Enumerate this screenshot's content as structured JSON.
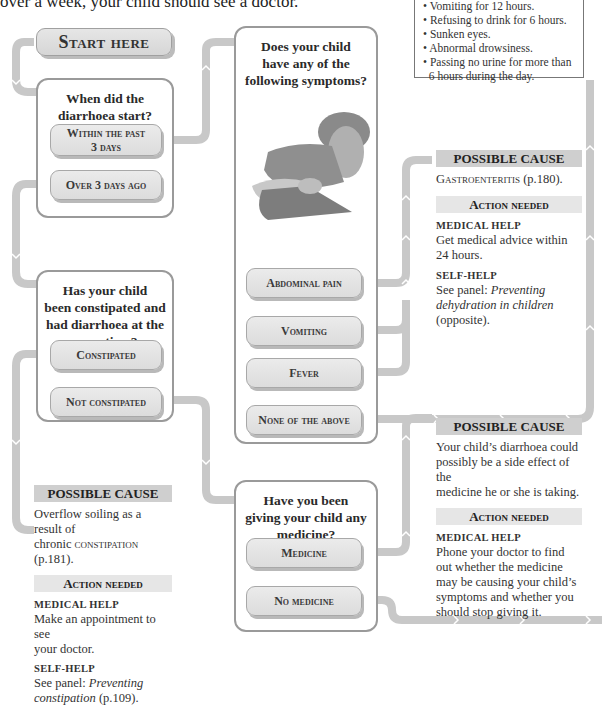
{
  "intro": {
    "text": "over a week, your child should see a doctor."
  },
  "warning_panel": {
    "items": [
      "Vomiting for 12 hours.",
      "Refusing to drink for 6 hours.",
      "Sunken eyes.",
      "Abnormal drowsiness.",
      "Passing no urine for more than",
      "6 hours during the day."
    ]
  },
  "start": {
    "label": "Start here"
  },
  "q1": {
    "title": [
      "When did the",
      "diarrhoea start?"
    ],
    "options": [
      {
        "label_line1": "Within the past",
        "label_line2": "3 days"
      },
      {
        "label_line1": "Over 3 days ago"
      }
    ]
  },
  "q2": {
    "title": [
      "Does your child",
      "have any of the",
      "following symptoms?"
    ],
    "image": "photo-of-child-holding-abdomen",
    "options": [
      {
        "label": "Abdominal pain"
      },
      {
        "label": "Vomiting"
      },
      {
        "label": "Fever"
      },
      {
        "label": "None of the above"
      }
    ]
  },
  "q3": {
    "title": [
      "Has your child",
      "been constipated and",
      "had diarrhoea at the",
      "same time?"
    ],
    "options": [
      {
        "label": "Constipated"
      },
      {
        "label": "Not constipated"
      }
    ]
  },
  "q4": {
    "title": [
      "Have you been",
      "giving your child any",
      "medicine?"
    ],
    "options": [
      {
        "label": "Medicine"
      },
      {
        "label": "No medicine"
      }
    ]
  },
  "result_gastro": {
    "cause_heading": "POSSIBLE CAUSE",
    "cause_condition": "Gastroenteritis",
    "cause_ref": " (p.180).",
    "action_heading": "Action needed",
    "medical_label": "MEDICAL HELP",
    "medical_text": [
      "Get medical advice within",
      "24 hours."
    ],
    "self_label": "SELF-HELP",
    "self_prefix": "See panel: ",
    "self_italic_1": "Preventing",
    "self_italic_2": "dehydration in children",
    "self_suffix": "(opposite)."
  },
  "result_constipation": {
    "cause_heading": "POSSIBLE CAUSE",
    "cause_line1": "Overflow soiling as a result of",
    "cause_prefix": "chronic ",
    "cause_condition": "constipation",
    "cause_ref": " (p.181).",
    "action_heading": "Action needed",
    "medical_label": "MEDICAL HELP",
    "medical_text": [
      "Make an appointment to see",
      "your doctor."
    ],
    "self_label": "SELF-HELP",
    "self_prefix": "See panel: ",
    "self_italic_1": "Preventing",
    "self_italic_2": "constipation",
    "self_suffix": " (p.109)."
  },
  "result_medicine": {
    "cause_heading": "POSSIBLE CAUSE",
    "cause_text": [
      "Your child’s diarrhoea could",
      "possibly be a side effect of the",
      "medicine he or she is taking."
    ],
    "action_heading": "Action needed",
    "medical_label": "MEDICAL HELP",
    "medical_text": [
      "Phone your doctor to find",
      "out whether the medicine",
      "may be causing your child’s",
      "symptoms and whether you",
      "should stop giving it."
    ]
  },
  "colors": {
    "connector": "#c8c8c8",
    "box_border": "#9a9a9a",
    "button_fill": "#e2e2e2",
    "cause_bg": "#cfcfcf",
    "action_bg": "#e6e6e6"
  }
}
